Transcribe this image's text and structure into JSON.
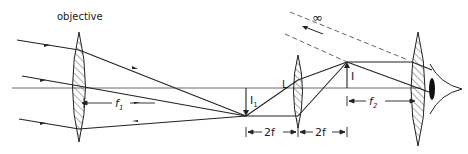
{
  "diagram": {
    "labels": {
      "objective": "objective",
      "infinity": "∞",
      "erecting_lens": "L",
      "intermediate_image": "I",
      "intermediate_image_sub": "1",
      "final_image": "I",
      "f1": "f",
      "f1_sub": "1",
      "f2": "f",
      "f2_sub": "2",
      "two_f_left": "2f",
      "two_f_right": "2f"
    },
    "elements": [
      {
        "name": "objective-lens",
        "x": 79,
        "y_top": 32,
        "y_bottom": 142
      },
      {
        "name": "erecting-lens-L",
        "x": 298,
        "y_top": 55,
        "y_bottom": 128
      },
      {
        "name": "eyepiece-lens",
        "x": 418,
        "y_top": 32,
        "y_bottom": 146
      },
      {
        "name": "eye",
        "x": 436,
        "y": 88
      }
    ],
    "colors": {
      "line": "#222222",
      "background": "#ffffff"
    }
  }
}
